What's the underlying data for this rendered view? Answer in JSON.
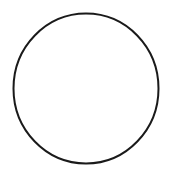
{
  "canvas": {
    "width": 175,
    "height": 179,
    "background": "#ffffff"
  },
  "shapes": [
    {
      "type": "ellipse",
      "cx": 86,
      "cy": 88.5,
      "rx": 72.5,
      "ry": 75,
      "stroke": "#1a1a1a",
      "stroke_width": 2,
      "fill": "none"
    }
  ]
}
